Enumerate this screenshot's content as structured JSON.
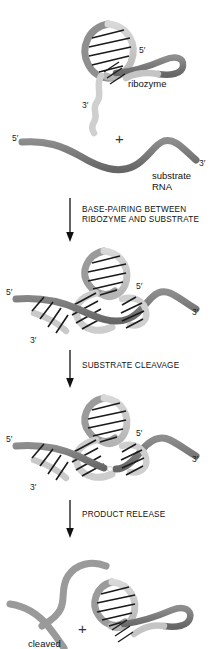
{
  "diagram": {
    "colors": {
      "ribozyme_strand": "#c9c9c9",
      "ribozyme_strand_dark": "#9d9d9d",
      "substrate_strand": "#7a7a7a",
      "substrate_strand_dark": "#6b6b6b",
      "base_pair_line": "#1a1a1a",
      "text": "#111111",
      "arrow": "#111111",
      "background": "#ffffff"
    },
    "stages": [
      {
        "id": "stage-reactants",
        "molecule_labels": [
          {
            "name": "ribozyme",
            "text": "ribozyme"
          },
          {
            "name": "substrate-rna",
            "text": "substrate\nRNA"
          }
        ],
        "end_labels": [
          {
            "name": "ribozyme-5-prime",
            "text": "5′"
          },
          {
            "name": "ribozyme-3-prime",
            "text": "3′"
          },
          {
            "name": "substrate-5-prime",
            "text": "5′"
          },
          {
            "name": "substrate-3-prime",
            "text": "3′"
          }
        ],
        "operator": "+"
      },
      {
        "id": "stage-base-paired-complex",
        "end_labels": [
          {
            "name": "substrate-5-prime",
            "text": "5′"
          },
          {
            "name": "ribozyme-3-prime",
            "text": "3′"
          },
          {
            "name": "ribozyme-5-prime",
            "text": "5′"
          },
          {
            "name": "substrate-3-prime",
            "text": "3′"
          }
        ]
      },
      {
        "id": "stage-cleaved-complex",
        "end_labels": [
          {
            "name": "substrate-5-prime",
            "text": "5′"
          },
          {
            "name": "ribozyme-3-prime",
            "text": "3′"
          },
          {
            "name": "ribozyme-5-prime",
            "text": "5′"
          },
          {
            "name": "substrate-3-prime",
            "text": "3′"
          }
        ]
      },
      {
        "id": "stage-products",
        "molecule_labels": [
          {
            "name": "cleaved-product",
            "text": "cleaved"
          }
        ],
        "operator": "+"
      }
    ],
    "transitions": [
      {
        "id": "transition-base-pairing",
        "text": "BASE-PAIRING BETWEEN\nRIBOZYME AND SUBSTRATE",
        "arrow": "down-arrow"
      },
      {
        "id": "transition-cleavage",
        "text": "SUBSTRATE CLEAVAGE",
        "arrow": "down-arrow"
      },
      {
        "id": "transition-release",
        "text": "PRODUCT RELEASE",
        "arrow": "down-arrow"
      }
    ]
  }
}
